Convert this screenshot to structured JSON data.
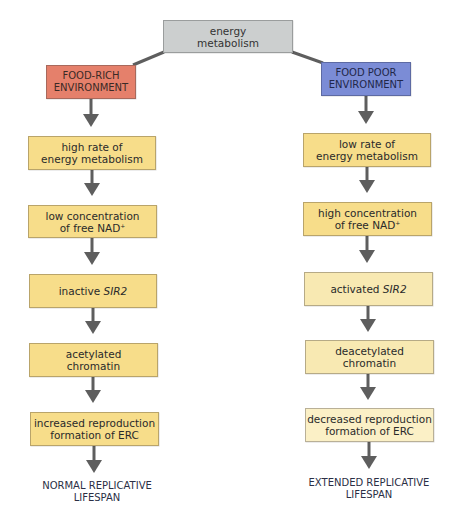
{
  "root": {
    "line1": "energy",
    "line2": "metabolism"
  },
  "colors": {
    "root_fill": "#cccfcf",
    "food_rich_fill": "#e5806b",
    "food_poor_fill": "#7b8cd6",
    "step_fill": "#f7dd8a",
    "step_fill_light": "#f8e9b2",
    "arrow": "#5e5e5e"
  },
  "left": {
    "header": {
      "line1": "FOOD-RICH",
      "line2": "ENVIRONMENT"
    },
    "steps": [
      {
        "line1": "high rate of",
        "line2": "energy metabolism"
      },
      {
        "line1": "low concentration",
        "line2_prefix": "of free NAD",
        "line2_sup": "+"
      },
      {
        "prefix": "inactive ",
        "italic": "SIR2"
      },
      {
        "line1": "acetylated",
        "line2": "chromatin"
      },
      {
        "line1": "increased reproduction",
        "line2": "formation of ERC"
      }
    ],
    "outcome": {
      "line1": "NORMAL REPLICATIVE",
      "line2": "LIFESPAN"
    }
  },
  "right": {
    "header": {
      "line1": "FOOD POOR",
      "line2": "ENVIRONMENT"
    },
    "steps": [
      {
        "line1": "low rate of",
        "line2": "energy metabolism"
      },
      {
        "line1": "high concentration",
        "line2_prefix": "of free NAD",
        "line2_sup": "+"
      },
      {
        "prefix": "activated ",
        "italic": "SIR2"
      },
      {
        "line1": "deacetylated",
        "line2": "chromatin"
      },
      {
        "line1": "decreased reproduction",
        "line2": "formation of ERC"
      }
    ],
    "outcome": {
      "line1": "EXTENDED REPLICATIVE",
      "line2": "LIFESPAN"
    }
  }
}
